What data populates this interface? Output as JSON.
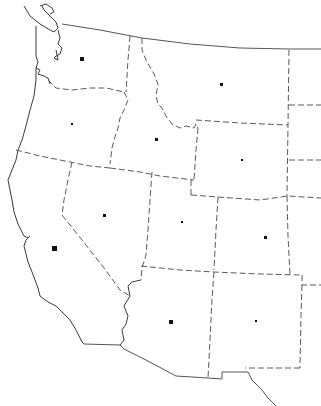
{
  "map": {
    "title": "",
    "region": "Western United States outline map",
    "colors": {
      "background": "#ffffff",
      "coastline": "#3a3a3a",
      "state_border": "#5a5a5a",
      "city_dot": "#111111"
    },
    "states": [
      {
        "id": "washington",
        "dot": {
          "x": 82,
          "y": 59,
          "size": 4
        }
      },
      {
        "id": "oregon",
        "dot": {
          "x": 72,
          "y": 124,
          "size": 2
        }
      },
      {
        "id": "idaho",
        "dot": {
          "x": 156,
          "y": 139,
          "size": 3
        }
      },
      {
        "id": "montana",
        "dot": {
          "x": 221,
          "y": 84,
          "size": 3
        }
      },
      {
        "id": "wyoming",
        "dot": {
          "x": 242,
          "y": 160,
          "size": 2
        }
      },
      {
        "id": "california",
        "dot": {
          "x": 54,
          "y": 248,
          "size": 5
        }
      },
      {
        "id": "nevada",
        "dot": {
          "x": 104,
          "y": 215,
          "size": 3
        }
      },
      {
        "id": "utah",
        "dot": {
          "x": 182,
          "y": 222,
          "size": 2
        }
      },
      {
        "id": "colorado",
        "dot": {
          "x": 265,
          "y": 237,
          "size": 3
        }
      },
      {
        "id": "arizona",
        "dot": {
          "x": 171,
          "y": 322,
          "size": 4
        }
      },
      {
        "id": "new-mexico",
        "dot": {
          "x": 256,
          "y": 321,
          "size": 2
        }
      }
    ]
  }
}
